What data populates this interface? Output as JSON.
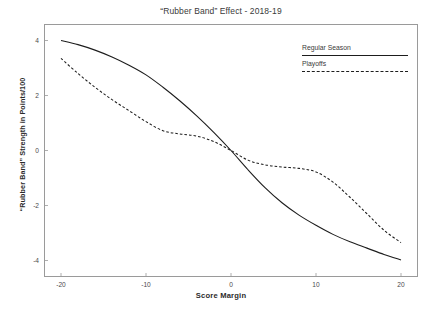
{
  "chart_data": {
    "type": "line",
    "title": "“Rubber Band” Effect - 2018-19",
    "subtitle": "",
    "xlabel": "Score Margin",
    "ylabel": "“Rubber Band” Strength in Points/100",
    "xlim": [
      -22,
      22
    ],
    "ylim": [
      -4.6,
      4.6
    ],
    "xticks": [
      -20,
      -10,
      0,
      10,
      20
    ],
    "xtick_labels": [
      "-20",
      "-10",
      "0",
      "10",
      "20"
    ],
    "yticks": [
      4,
      2,
      0,
      -2,
      -4
    ],
    "ytick_labels": [
      "4",
      "2",
      "0",
      "-2",
      "-4"
    ],
    "grid": false,
    "legend_position": "top-right",
    "series": [
      {
        "name": "Regular Season",
        "style": "solid",
        "color": "#1d1d1d",
        "x": [
          -20,
          -18,
          -16,
          -14,
          -12,
          -10,
          -8,
          -6,
          -4,
          -2,
          0,
          2,
          4,
          6,
          8,
          10,
          12,
          14,
          16,
          18,
          20
        ],
        "values": [
          4.0,
          3.85,
          3.65,
          3.4,
          3.1,
          2.75,
          2.3,
          1.8,
          1.25,
          0.65,
          0.0,
          -0.7,
          -1.35,
          -1.9,
          -2.35,
          -2.72,
          -3.05,
          -3.32,
          -3.55,
          -3.78,
          -3.98
        ]
      },
      {
        "name": "Playoffs",
        "style": "dashed",
        "color": "#1d1d1d",
        "x": [
          -20,
          -18,
          -16,
          -14,
          -12,
          -10,
          -8,
          -6,
          -4,
          -2,
          0,
          2,
          4,
          6,
          8,
          10,
          12,
          14,
          16,
          18,
          20
        ],
        "values": [
          3.35,
          2.8,
          2.3,
          1.85,
          1.45,
          1.05,
          0.72,
          0.6,
          0.52,
          0.32,
          0.0,
          -0.35,
          -0.52,
          -0.6,
          -0.65,
          -0.78,
          -1.15,
          -1.7,
          -2.3,
          -2.9,
          -3.35
        ]
      }
    ]
  },
  "legend": {
    "items": [
      {
        "label": "Regular Season",
        "style": "solid"
      },
      {
        "label": "Playoffs",
        "style": "dashed"
      }
    ]
  }
}
